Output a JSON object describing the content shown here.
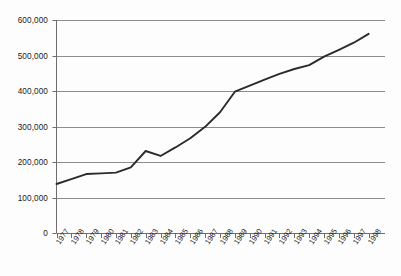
{
  "chart_data": {
    "type": "line",
    "title": "",
    "subtitle": "",
    "xlabel": "",
    "ylabel": "",
    "categories": [
      "1977",
      "1978",
      "1979",
      "1980",
      "1981",
      "1982",
      "1983",
      "1984",
      "1985",
      "1986",
      "1987",
      "1988",
      "1989",
      "1990",
      "1991",
      "1992",
      "1993",
      "1994",
      "1995",
      "1996",
      "1997",
      "1998"
    ],
    "values": [
      138000,
      152000,
      166000,
      168000,
      170000,
      185000,
      231000,
      217000,
      241000,
      267000,
      299000,
      340000,
      398000,
      415000,
      432000,
      448000,
      462000,
      473000,
      497000,
      516000,
      536000,
      561000
    ],
    "series": [
      {
        "name": "series-1",
        "values": [
          138000,
          152000,
          166000,
          168000,
          170000,
          185000,
          231000,
          217000,
          241000,
          267000,
          299000,
          340000,
          398000,
          415000,
          432000,
          448000,
          462000,
          473000,
          497000,
          516000,
          536000,
          561000
        ],
        "color": "#2b2b2b"
      }
    ],
    "ylim": [
      0,
      600000
    ],
    "yticks": [
      0,
      100000,
      200000,
      300000,
      400000,
      500000,
      600000
    ],
    "ytick_labels": [
      "0",
      "100,000",
      "200,000",
      "300,000",
      "400,000",
      "500,000",
      "600,000"
    ],
    "xtick_labels": [
      "1977",
      "1978",
      "1979",
      "1980",
      "1981",
      "1982",
      "1983",
      "1984",
      "1985",
      "1986",
      "1987",
      "1988",
      "1989",
      "1990",
      "1991",
      "1992",
      "1993",
      "1994",
      "1995",
      "1996",
      "1997",
      "1998"
    ],
    "grid": true,
    "grid_axis": "y",
    "grid_color": "#8c8c8c",
    "legend": false,
    "legend_position": "none",
    "annotations": [],
    "line_color": "#2b2b2b",
    "line_width": 1.9,
    "axis_color": "#6e6e6e",
    "background_color": "#fdfdfd"
  }
}
